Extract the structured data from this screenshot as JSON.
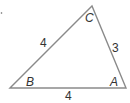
{
  "diagram": {
    "type": "triangle",
    "vertices": {
      "A": "A",
      "B": "B",
      "C": "C"
    },
    "sides": {
      "BC": "4",
      "CA": "3",
      "BA": "4"
    },
    "colors": {
      "stroke": "#8a8a8a",
      "text": "#333333"
    }
  }
}
